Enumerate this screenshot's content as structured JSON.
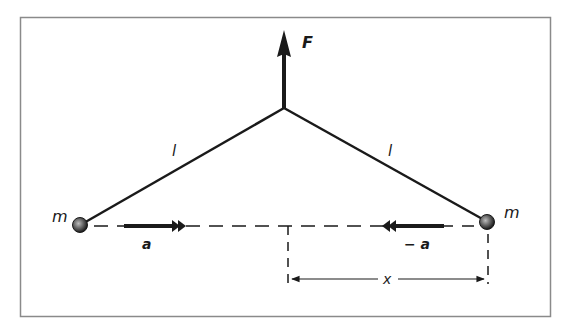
{
  "figure": {
    "type": "physics-diagram",
    "colors": {
      "ink": "#1a1a1a",
      "frame": "#8a8a8a",
      "background": "#ffffff"
    },
    "labels": {
      "force": "F",
      "rod_left": "l",
      "rod_right": "l",
      "mass_left": "m",
      "mass_right": "m",
      "accel_left": "a",
      "accel_right": "− a",
      "distance": "x"
    }
  }
}
